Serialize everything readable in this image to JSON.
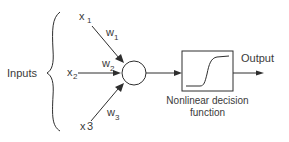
{
  "diagram": {
    "inputs_group_label": "Inputs",
    "inputs": [
      {
        "name": "x",
        "sub": "1",
        "weight": "w",
        "weight_sub": "1"
      },
      {
        "name": "x",
        "sub": "2",
        "weight": "w",
        "weight_sub": "2"
      },
      {
        "name": "x",
        "sub": "3",
        "weight": "w",
        "weight_sub": "3"
      }
    ],
    "node": "summation-neuron",
    "function_box_label_line1": "Nonlinear decision",
    "function_box_label_line2": "function",
    "function_icon": "sigmoid-curve-icon",
    "output_label": "Output",
    "colors": {
      "stroke": "#2e2e2e",
      "text": "#3a3a3a",
      "background": "#ffffff"
    }
  }
}
